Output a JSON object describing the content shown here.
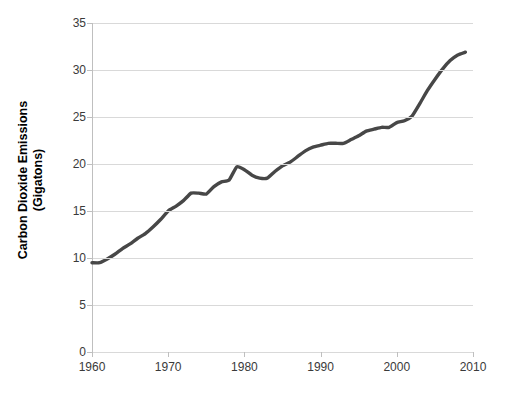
{
  "chart_data": {
    "type": "line",
    "title": "",
    "xlabel": "",
    "ylabel_line1": "Carbon Dioxide Emissions",
    "ylabel_line2": "(Gigatons)",
    "ylabel": "Carbon Dioxide Emissions (Gigatons)",
    "xlim": [
      1960,
      2010
    ],
    "ylim": [
      0,
      35
    ],
    "xticks": [
      1960,
      1970,
      1980,
      1990,
      2000,
      2010
    ],
    "xtick_labels": [
      "1960",
      "1970",
      "1980",
      "1990",
      "2000",
      "2010"
    ],
    "yticks": [
      0,
      5,
      10,
      15,
      20,
      25,
      30,
      35
    ],
    "ytick_labels": [
      "0",
      "5",
      "10",
      "15",
      "20",
      "25",
      "30",
      "35"
    ],
    "grid": "horizontal",
    "legend": "none",
    "series": [
      {
        "name": "Global CO2 emissions",
        "color": "#474747",
        "line_width": 3.4,
        "x": [
          1960,
          1961,
          1962,
          1963,
          1964,
          1965,
          1966,
          1967,
          1968,
          1969,
          1970,
          1971,
          1972,
          1973,
          1974,
          1975,
          1976,
          1977,
          1978,
          1979,
          1980,
          1981,
          1982,
          1983,
          1984,
          1985,
          1986,
          1987,
          1988,
          1989,
          1990,
          1991,
          1992,
          1993,
          1994,
          1995,
          1996,
          1997,
          1998,
          1999,
          2000,
          2001,
          2002,
          2003,
          2004,
          2005,
          2006,
          2007,
          2008,
          2009
        ],
        "values": [
          9.5,
          9.5,
          9.9,
          10.4,
          11.0,
          11.5,
          12.1,
          12.6,
          13.3,
          14.1,
          15.0,
          15.5,
          16.1,
          16.9,
          16.9,
          16.8,
          17.6,
          18.1,
          18.3,
          19.7,
          19.4,
          18.8,
          18.5,
          18.5,
          19.2,
          19.8,
          20.2,
          20.8,
          21.4,
          21.8,
          22.0,
          22.2,
          22.2,
          22.2,
          22.6,
          23.0,
          23.5,
          23.7,
          23.9,
          23.9,
          24.4,
          24.6,
          25.1,
          26.4,
          27.8,
          29.0,
          30.1,
          31.0,
          31.6,
          31.9
        ]
      }
    ]
  },
  "axes": {
    "grid_color": "#d9d9d9",
    "axis_color": "#bfbfbf",
    "tick_text_color": "#3a3a3a",
    "label_text_color": "#000000",
    "background": "#ffffff"
  }
}
